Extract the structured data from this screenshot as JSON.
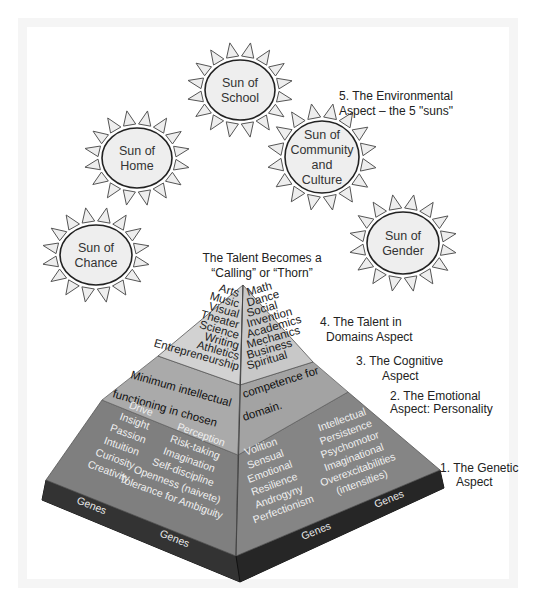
{
  "colors": {
    "sun_fill": "#eeeeee",
    "sun_stroke": "#222222",
    "domains_band": "#cfcfcf",
    "cognitive_band": "#a9a9a9",
    "emotional_band": "#808080",
    "genes_band": "#2e2e2e",
    "text_dark": "#222222",
    "text_light": "#f0f0f0"
  },
  "suns": [
    {
      "id": "school",
      "lines": [
        "Sun of",
        "School"
      ]
    },
    {
      "id": "home",
      "lines": [
        "Sun of",
        "Home"
      ]
    },
    {
      "id": "community",
      "lines": [
        "Sun of",
        "Community",
        "and",
        "Culture"
      ]
    },
    {
      "id": "chance",
      "lines": [
        "Sun of",
        "Chance"
      ]
    },
    {
      "id": "gender",
      "lines": [
        "Sun of",
        "Gender"
      ]
    }
  ],
  "apex_label": [
    "The Talent Becomes a",
    "“Calling” or “Thorn”"
  ],
  "aspects": {
    "environmental": [
      "5.  The Environmental",
      "Aspect – the 5 \"suns\""
    ],
    "domains": [
      "4.  The Talent in",
      "Domains Aspect"
    ],
    "cognitive": [
      "3.  The Cognitive",
      "Aspect"
    ],
    "emotional": [
      "2.  The Emotional",
      "Aspect: Personality"
    ],
    "genetic": [
      "1.  The Genetic",
      "Aspect"
    ]
  },
  "domains": {
    "left": [
      "Arts",
      "Music",
      "Visual",
      "Theater",
      "Science",
      "Writing",
      "Athletics",
      "Entrepreneurship"
    ],
    "right": [
      "Math",
      "Dance",
      "Social",
      "Invention",
      "Academics",
      "Mechanics",
      "Business",
      "Spiritual"
    ]
  },
  "cognitive": {
    "line1_left": "Minimum intellectual",
    "line1_right": "competence for",
    "line2_left": "functioning in chosen",
    "line2_right": "domain."
  },
  "emotional": {
    "left_col1": [
      "Drive",
      "Insight",
      "Passion",
      "Intuition",
      "Curiosity",
      "Creativity"
    ],
    "left_col2": [
      "Perception",
      "Risk-taking",
      "Imagination",
      "Self-discipline",
      "Openness (naivete)",
      "Tolerance for Ambiguity"
    ],
    "right_col1": [
      "Volition",
      "Sensual",
      "Emotional",
      "Resilience",
      "Androgyny",
      "Perfectionism"
    ],
    "right_col2": [
      "Intellectual",
      "Persistence",
      "Psychomotor",
      "Imaginational",
      "Overexcitabilities",
      "(intensities)"
    ]
  },
  "genes": [
    "Genes",
    "Genes",
    "Genes",
    "Genes"
  ]
}
